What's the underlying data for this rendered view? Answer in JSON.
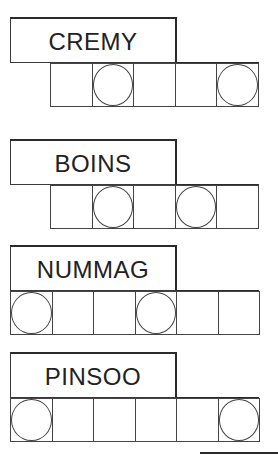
{
  "puzzles": [
    {
      "scrambled": "CREMY",
      "cells": 5,
      "grid_left": 50,
      "top": 17,
      "circled": [
        1,
        4
      ],
      "answer": [
        "",
        "",
        "",
        "",
        ""
      ]
    },
    {
      "scrambled": "BOINS",
      "cells": 5,
      "grid_left": 50,
      "top": 139,
      "circled": [
        1,
        3
      ],
      "answer": [
        "",
        "",
        "",
        "",
        ""
      ]
    },
    {
      "scrambled": "NUMMAG",
      "cells": 6,
      "grid_left": 10,
      "top": 245,
      "circled": [
        0,
        3
      ],
      "answer": [
        "",
        "",
        "",
        "",
        "",
        ""
      ]
    },
    {
      "scrambled": "PINSOO",
      "cells": 6,
      "grid_left": 10,
      "top": 352,
      "circled": [
        0,
        5
      ],
      "answer": [
        "",
        "",
        "",
        "",
        "",
        ""
      ]
    }
  ],
  "colors": {
    "line": "#2a2a2a",
    "text": "#222222",
    "background": "#ffffff"
  }
}
